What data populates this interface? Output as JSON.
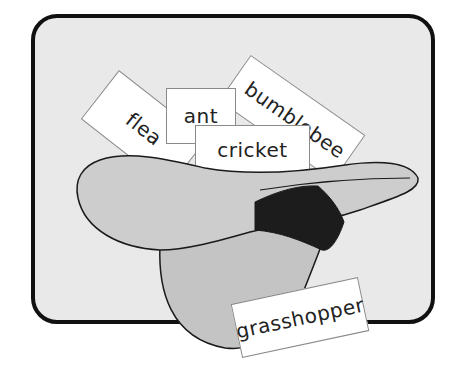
{
  "illustration": {
    "description": "Hat with word cards",
    "colors": {
      "background": "#e9e9e9",
      "frame_border": "#111111",
      "hat": "#c8c8c8",
      "hat_band": "#1c1c1c",
      "card": "#ffffff"
    },
    "cards": [
      {
        "label": "flea"
      },
      {
        "label": "ant"
      },
      {
        "label": "bumblebee"
      },
      {
        "label": "cricket"
      },
      {
        "label": "grasshopper"
      }
    ]
  }
}
